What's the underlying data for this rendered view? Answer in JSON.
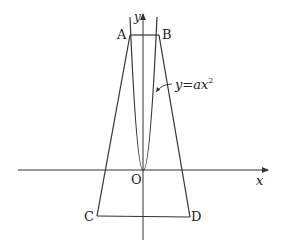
{
  "diagram": {
    "curve_label": "y=ax",
    "curve_exponent": "2",
    "axes": {
      "x_label": "x",
      "y_label": "y",
      "origin_label": "O"
    },
    "points": {
      "A": {
        "label": "A",
        "px": [
          130,
          35
        ]
      },
      "B": {
        "label": "B",
        "px": [
          159,
          35
        ]
      },
      "C": {
        "label": "C",
        "px": [
          97,
          216
        ]
      },
      "D": {
        "label": "D",
        "px": [
          190,
          217
        ]
      },
      "O": {
        "label": "O",
        "px": [
          143,
          170
        ]
      }
    },
    "segments": [
      "AB",
      "AC",
      "BD",
      "CD"
    ],
    "stroke_color": "#333333"
  }
}
